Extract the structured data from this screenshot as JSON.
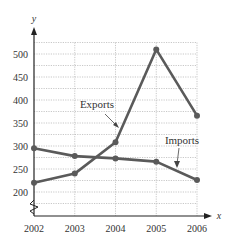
{
  "chart_data": {
    "type": "line",
    "title": "",
    "xlabel": "x",
    "ylabel": "y",
    "categories": [
      "2002",
      "2003",
      "2004",
      "2005",
      "2006"
    ],
    "x": [
      2002,
      2003,
      2004,
      2005,
      2006
    ],
    "series": [
      {
        "name": "Exports",
        "values": [
          220,
          240,
          308,
          510,
          366
        ]
      },
      {
        "name": "Imports",
        "values": [
          295,
          278,
          273,
          266,
          226
        ]
      }
    ],
    "yticks": [
      200,
      250,
      300,
      350,
      400,
      450,
      500
    ],
    "ylim": [
      150,
      550
    ],
    "y_axis_break": true,
    "grid": true,
    "legend": "inline-annotations",
    "annotations": [
      {
        "text": "Exports",
        "points_to_series": "Exports"
      },
      {
        "text": "Imports",
        "points_to_series": "Imports"
      }
    ],
    "colors": {
      "line": "#5a5a5a",
      "grid": "#b0b0b0",
      "axis": "#222222"
    }
  }
}
